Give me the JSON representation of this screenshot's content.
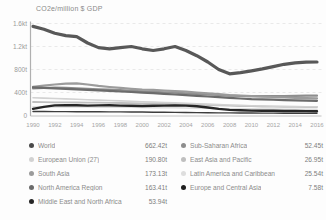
{
  "chart": {
    "title": "CO2e/million $ GDP"
  },
  "chart_data": {
    "type": "line",
    "title": "CO2e/million $ GDP",
    "xlabel": "",
    "ylabel": "CO2e/million $ GDP",
    "x": [
      1990,
      1991,
      1992,
      1993,
      1994,
      1995,
      1996,
      1997,
      1998,
      1999,
      2000,
      2001,
      2002,
      2003,
      2004,
      2005,
      2006,
      2007,
      2008,
      2009,
      2010,
      2011,
      2012,
      2013,
      2014,
      2015,
      2016
    ],
    "x_tick_labels": [
      "1990",
      "1992",
      "1994",
      "1996",
      "1998",
      "2000",
      "2002",
      "2004",
      "2006",
      "2008",
      "2010",
      "2012",
      "2014",
      "2016"
    ],
    "ylim": [
      0,
      1600
    ],
    "y_tick_values": [
      0,
      400,
      800,
      1200,
      1600
    ],
    "y_tick_labels": [
      "0",
      "400t",
      "800t",
      "1.2kt",
      "1.6kt"
    ],
    "grid": "dashed-horizontal",
    "legend_position": "bottom-two-columns",
    "units": "t CO2e per million $ GDP (values estimated from pixels)",
    "series": [
      {
        "name": "Latin America and Caribbean",
        "color": "#dedede",
        "stroke_width": 1.6,
        "values": [
          150,
          150,
          149,
          149,
          148,
          147,
          146,
          145,
          144,
          142,
          140,
          138,
          136,
          134,
          131,
          128,
          125,
          122,
          119,
          116,
          114,
          112,
          111,
          110,
          109,
          108,
          108
        ]
      },
      {
        "name": "East Asia and Pacific",
        "color": "#bfbfbf",
        "stroke_width": 1.8,
        "values": [
          235,
          232,
          230,
          228,
          226,
          224,
          222,
          220,
          218,
          215,
          212,
          208,
          204,
          200,
          195,
          189,
          183,
          177,
          171,
          166,
          161,
          157,
          154,
          151,
          149,
          148,
          147
        ]
      },
      {
        "name": "European Union (27)",
        "color": "#d2d2d2",
        "stroke_width": 1.6,
        "values": [
          310,
          303,
          296,
          289,
          282,
          275,
          268,
          261,
          254,
          247,
          240,
          233,
          226,
          219,
          212,
          205,
          198,
          190,
          183,
          176,
          170,
          166,
          162,
          158,
          155,
          153,
          152
        ]
      },
      {
        "name": "Sub-Saharan Africa",
        "color": "#8d8d8d",
        "stroke_width": 2.2,
        "values": [
          470,
          478,
          484,
          480,
          472,
          464,
          456,
          448,
          440,
          430,
          420,
          412,
          404,
          396,
          386,
          376,
          366,
          356,
          346,
          340,
          336,
          336,
          338,
          340,
          342,
          344,
          345
        ]
      },
      {
        "name": "South Asia",
        "color": "#9b9b9b",
        "stroke_width": 2.2,
        "values": [
          500,
          520,
          540,
          555,
          560,
          540,
          515,
          495,
          480,
          465,
          450,
          445,
          435,
          425,
          415,
          400,
          385,
          370,
          355,
          345,
          335,
          328,
          322,
          315,
          308,
          302,
          298
        ]
      },
      {
        "name": "North America Region",
        "color": "#6b6b6b",
        "stroke_width": 2.2,
        "values": [
          490,
          482,
          473,
          465,
          456,
          447,
          438,
          428,
          418,
          408,
          398,
          388,
          378,
          366,
          354,
          342,
          330,
          318,
          306,
          295,
          286,
          280,
          274,
          268,
          262,
          258,
          255
        ]
      },
      {
        "name": "Europe and Central Asia",
        "color": "#3d3d3d",
        "stroke_width": 1.4,
        "values": [
          70,
          69,
          68,
          67,
          66,
          65,
          64,
          63,
          62,
          61,
          60,
          58,
          56,
          54,
          52,
          50,
          48,
          46,
          45,
          44,
          43,
          42,
          41,
          40,
          40,
          39,
          39
        ]
      },
      {
        "name": "Middle East and North Africa",
        "color": "#262626",
        "stroke_width": 2.4,
        "values": [
          115,
          150,
          175,
          180,
          178,
          172,
          175,
          178,
          172,
          168,
          165,
          170,
          173,
          175,
          172,
          160,
          140,
          115,
          98,
          90,
          86,
          83,
          81,
          79,
          78,
          76,
          75
        ]
      },
      {
        "name": "World",
        "color": "#585858",
        "stroke_width": 3.2,
        "values": [
          1550,
          1500,
          1430,
          1390,
          1370,
          1260,
          1180,
          1160,
          1180,
          1200,
          1160,
          1130,
          1160,
          1200,
          1130,
          1040,
          930,
          800,
          725,
          745,
          775,
          810,
          850,
          890,
          915,
          928,
          930
        ]
      }
    ]
  },
  "legend": {
    "columns": [
      {
        "items": [
          {
            "label": "World",
            "value": "662.42t",
            "color": "#4a4a4a"
          },
          {
            "label": "European Union (27)",
            "value": "190.80t",
            "color": "#d2d2d2"
          },
          {
            "label": "South Asia",
            "value": "173.13t",
            "color": "#9b9b9b"
          },
          {
            "label": "North America Region",
            "value": "163.41t",
            "color": "#6b6b6b"
          },
          {
            "label": "Middle East and North Africa",
            "value": "53.94t",
            "color": "#262626"
          }
        ]
      },
      {
        "items": [
          {
            "label": "Sub-Saharan Africa",
            "value": "52.45t",
            "color": "#8d8d8d"
          },
          {
            "label": "East Asia and Pacific",
            "value": "26.95t",
            "color": "#bfbfbf"
          },
          {
            "label": "Latin America and Caribbean",
            "value": "25.54t",
            "color": "#dedede"
          },
          {
            "label": "Europe and Central Asia",
            "value": "7.58t",
            "color": "#1f1f1f"
          }
        ]
      }
    ]
  }
}
